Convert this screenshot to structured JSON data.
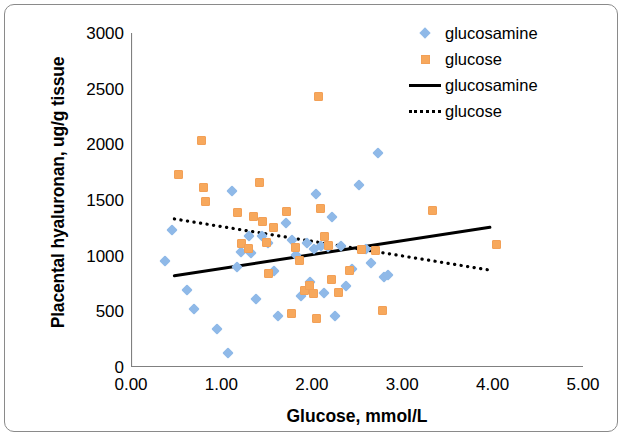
{
  "chart_data": {
    "type": "scatter",
    "title": "",
    "xlabel": "Glucose, mmol/L",
    "ylabel": "Placental hyaluronan, ug/g tissue",
    "xlim": [
      0.0,
      5.0
    ],
    "ylim": [
      0,
      3000
    ],
    "xticks": [
      "0.00",
      "1.00",
      "2.00",
      "3.00",
      "4.00",
      "5.00"
    ],
    "yticks": [
      "0",
      "500",
      "1000",
      "1500",
      "2000",
      "2500",
      "3000"
    ],
    "xtick_values": [
      0.0,
      1.0,
      2.0,
      3.0,
      4.0,
      5.0
    ],
    "ytick_values": [
      0,
      500,
      1000,
      1500,
      2000,
      2500,
      3000
    ],
    "grid": false,
    "legend_position": "top-right",
    "colors": {
      "glucosamine_marker": "#8fb9e8",
      "glucose_marker": "#f7a85c",
      "glucosamine_line": "#000000",
      "glucose_line": "#000000",
      "axis": "#808080",
      "frame": "#8a8a8a"
    },
    "series": [
      {
        "name": "glucosamine",
        "marker": "diamond",
        "color": "#8fb9e8",
        "points": [
          [
            0.38,
            950
          ],
          [
            0.45,
            1230
          ],
          [
            0.62,
            695
          ],
          [
            0.7,
            525
          ],
          [
            0.95,
            340
          ],
          [
            1.07,
            130
          ],
          [
            1.12,
            1580
          ],
          [
            1.17,
            895
          ],
          [
            1.22,
            1035
          ],
          [
            1.3,
            1180
          ],
          [
            1.33,
            1020
          ],
          [
            1.38,
            610
          ],
          [
            1.45,
            1175
          ],
          [
            1.52,
            1115
          ],
          [
            1.58,
            860
          ],
          [
            1.63,
            455
          ],
          [
            1.72,
            1290
          ],
          [
            1.78,
            1140
          ],
          [
            1.82,
            1005
          ],
          [
            1.88,
            640
          ],
          [
            1.95,
            1110
          ],
          [
            1.98,
            760
          ],
          [
            2.02,
            1060
          ],
          [
            2.05,
            1555
          ],
          [
            2.1,
            1090
          ],
          [
            2.14,
            665
          ],
          [
            2.18,
            1075
          ],
          [
            2.22,
            1345
          ],
          [
            2.26,
            455
          ],
          [
            2.32,
            1085
          ],
          [
            2.38,
            725
          ],
          [
            2.45,
            880
          ],
          [
            2.52,
            1635
          ],
          [
            2.6,
            1060
          ],
          [
            2.66,
            930
          ],
          [
            2.73,
            1920
          ],
          [
            2.8,
            805
          ],
          [
            2.84,
            830
          ]
        ]
      },
      {
        "name": "glucose",
        "marker": "square",
        "color": "#f7a85c",
        "points": [
          [
            0.52,
            1725
          ],
          [
            0.78,
            2035
          ],
          [
            0.8,
            1610
          ],
          [
            0.82,
            1490
          ],
          [
            1.18,
            1385
          ],
          [
            1.22,
            1105
          ],
          [
            1.3,
            1065
          ],
          [
            1.36,
            1350
          ],
          [
            1.42,
            1655
          ],
          [
            1.46,
            1310
          ],
          [
            1.5,
            1120
          ],
          [
            1.52,
            840
          ],
          [
            1.58,
            1255
          ],
          [
            1.72,
            1395
          ],
          [
            1.78,
            480
          ],
          [
            1.82,
            1075
          ],
          [
            1.86,
            955
          ],
          [
            1.92,
            690
          ],
          [
            1.98,
            735
          ],
          [
            2.02,
            660
          ],
          [
            2.05,
            435
          ],
          [
            2.07,
            2430
          ],
          [
            2.1,
            1425
          ],
          [
            2.14,
            1170
          ],
          [
            2.18,
            1090
          ],
          [
            2.22,
            790
          ],
          [
            2.3,
            670
          ],
          [
            2.42,
            870
          ],
          [
            2.55,
            1055
          ],
          [
            2.7,
            1045
          ],
          [
            2.78,
            505
          ],
          [
            3.33,
            1410
          ],
          [
            4.04,
            1100
          ]
        ]
      }
    ],
    "trendlines": [
      {
        "name": "glucosamine",
        "style": "solid",
        "color": "#000000",
        "x_start": 0.48,
        "y_start": 820,
        "x_end": 3.97,
        "y_end": 1255
      },
      {
        "name": "glucose",
        "style": "dotted",
        "color": "#000000",
        "x_start": 0.48,
        "y_start": 1330,
        "x_end": 3.97,
        "y_end": 870
      }
    ],
    "legend": [
      {
        "label": "glucosamine",
        "key": "diamond-marker",
        "color": "#8fb9e8"
      },
      {
        "label": "glucose",
        "key": "square-marker",
        "color": "#f7a85c"
      },
      {
        "label": "glucosamine",
        "key": "solid-line",
        "color": "#000000"
      },
      {
        "label": "glucose",
        "key": "dotted-line",
        "color": "#000000"
      }
    ]
  }
}
